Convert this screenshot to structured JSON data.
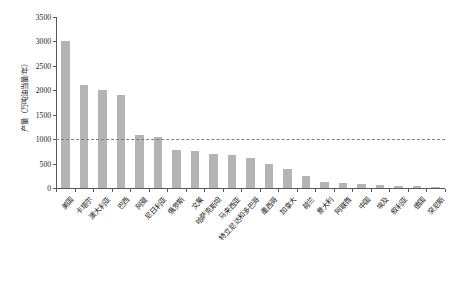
{
  "chart_data": {
    "type": "bar",
    "title": "",
    "xlabel": "",
    "ylabel": "产量（万吨油当量/年）",
    "ylim": [
      0,
      3500
    ],
    "ytick_step": 500,
    "yticks": [
      0,
      500,
      1000,
      1500,
      2000,
      2500,
      3000,
      3500
    ],
    "ytick_labels": [
      "0",
      "500",
      "1000",
      "1500",
      "2000",
      "2500",
      "3000",
      "3500"
    ],
    "grid": false,
    "legend": null,
    "bar_color": "#b4b4b4",
    "reference_line": {
      "value": 1000,
      "style": "dashed",
      "color": "#808080",
      "label": ""
    },
    "categories": [
      "美国",
      "卡塔尔",
      "澳大利亚",
      "巴西",
      "阿曼",
      "尼日利亚",
      "俄罗斯",
      "文莱",
      "哈萨克斯坦",
      "马来西亚",
      "特立尼达和多巴哥",
      "墨西哥",
      "加拿大",
      "荷兰",
      "意大利",
      "阿联酋",
      "中国",
      "埃及",
      "叙利亚",
      "德国",
      "突尼斯"
    ],
    "values": [
      3000,
      2100,
      2000,
      1900,
      1080,
      1050,
      780,
      750,
      700,
      680,
      620,
      500,
      380,
      240,
      130,
      110,
      90,
      70,
      50,
      40,
      30
    ]
  }
}
